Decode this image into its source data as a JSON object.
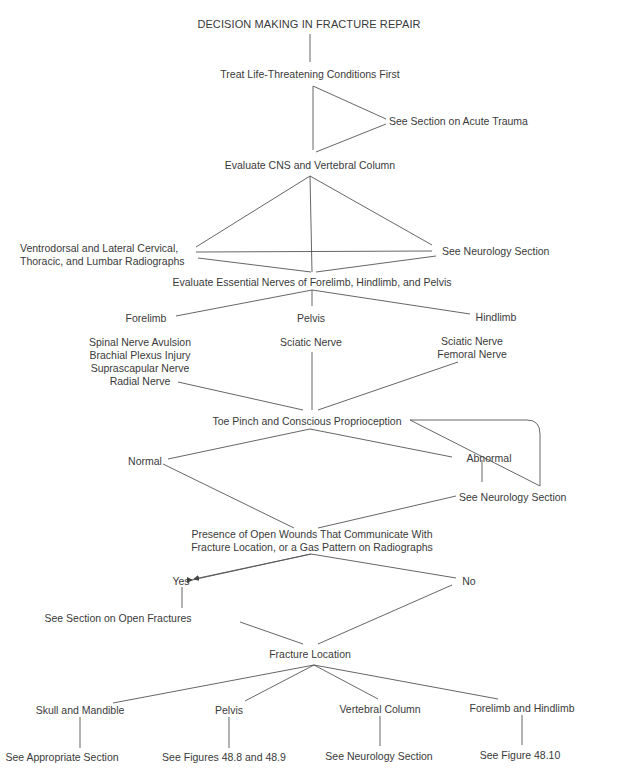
{
  "title": "DECISION MAKING IN FRACTURE REPAIR",
  "nodes": {
    "life_threatening": "Treat Life-Threatening Conditions First",
    "acute_trauma": "See Section on Acute Trauma",
    "evaluate_cns": "Evaluate CNS and Vertebral Column",
    "radiographs_line1": "Ventrodorsal and Lateral Cervical,",
    "radiographs_line2": "Thoracic, and Lumbar Radiographs",
    "neurology_section_1": "See Neurology Section",
    "evaluate_nerves": "Evaluate Essential Nerves of Forelimb, Hindlimb, and Pelvis",
    "forelimb": "Forelimb",
    "pelvis": "Pelvis",
    "hindlimb": "Hindlimb",
    "forelimb_nerves": [
      "Spinal Nerve Avulsion",
      "Brachial Plexus Injury",
      "Suprascapular Nerve",
      "Radial Nerve"
    ],
    "pelvis_nerves": [
      "Sciatic Nerve"
    ],
    "hindlimb_nerves": [
      "Sciatic Nerve",
      "Femoral Nerve"
    ],
    "toe_pinch": "Toe Pinch and Conscious Proprioception",
    "normal": "Normal",
    "abnormal": "Abnormal",
    "neurology_section_2": "See Neurology Section",
    "open_wounds_line1": "Presence of Open Wounds That Communicate With",
    "open_wounds_line2": "Fracture Location, or a Gas Pattern on Radiographs",
    "yes": "Yes",
    "no": "No",
    "open_fractures": "See Section on Open Fractures",
    "fracture_location": "Fracture Location",
    "locations": [
      {
        "label": "Skull and Mandible",
        "outcome": "See Appropriate Section"
      },
      {
        "label": "Pelvis",
        "outcome": "See Figures 48.8 and 48.9"
      },
      {
        "label": "Vertebral Column",
        "outcome": "See Neurology Section"
      },
      {
        "label": "Forelimb and Hindlimb",
        "outcome": "See Figure 48.10"
      }
    ]
  },
  "colors": {
    "text": "#3a3a3a",
    "lines": "#555555",
    "background": "#ffffff"
  }
}
